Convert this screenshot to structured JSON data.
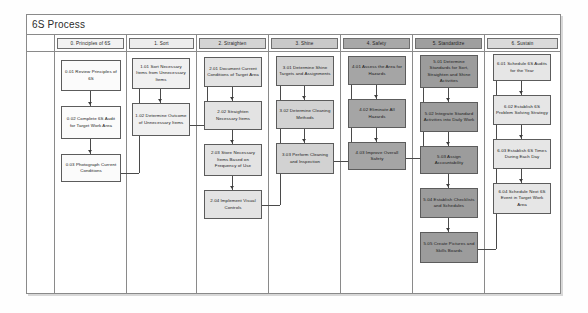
{
  "document": {
    "title": "6S Process"
  },
  "lanes": [
    {
      "id": "lane-principles",
      "label": "0. Principles of 6S"
    },
    {
      "id": "lane-sort",
      "label": "1. Sort"
    },
    {
      "id": "lane-straighten",
      "label": "2. Straighten"
    },
    {
      "id": "lane-shine",
      "label": "3. Shine"
    },
    {
      "id": "lane-safety",
      "label": "4. Safety"
    },
    {
      "id": "lane-standardize",
      "label": "5. Standardize"
    },
    {
      "id": "lane-sustain",
      "label": "6. Sustain"
    }
  ],
  "nodes": {
    "c0": [
      {
        "id": "0.01",
        "label": "0.01 Review Principles of 6S"
      },
      {
        "id": "0.02",
        "label": "0.02 Complete 6S Audit for Target Work Area"
      },
      {
        "id": "0.03",
        "label": "0.03 Photograph Current Conditions"
      }
    ],
    "c1": [
      {
        "id": "1.01",
        "label": "1.01 Sort Necessary Items from Unnecessary Items"
      },
      {
        "id": "1.02",
        "label": "1.02 Determine Outcome of Unnecessary Items"
      }
    ],
    "c2": [
      {
        "id": "2.01",
        "label": "2.01 Document Current Conditions of Target Area"
      },
      {
        "id": "2.02",
        "label": "2.02 Straighten Necessary Items"
      },
      {
        "id": "2.03",
        "label": "2.03 Store Necessary Items Based on Frequency of Use"
      },
      {
        "id": "2.04",
        "label": "2.04 Implement Visual Controls"
      }
    ],
    "c3": [
      {
        "id": "3.01",
        "label": "3.01 Determine Shine Targets and Assignments"
      },
      {
        "id": "3.02",
        "label": "3.02 Determine Cleaning Methods"
      },
      {
        "id": "3.03",
        "label": "3.03 Perform Cleaning and Inspection"
      }
    ],
    "c4": [
      {
        "id": "4.01",
        "label": "4.01 Assess the Area for Hazards"
      },
      {
        "id": "4.02",
        "label": "4.02 Eliminate All Hazards"
      },
      {
        "id": "4.03",
        "label": "4.03 Improve Overall Safety"
      }
    ],
    "c5": [
      {
        "id": "5.01",
        "label": "5.01 Determine Standards for Sort, Straighten and Shine Activities"
      },
      {
        "id": "5.02",
        "label": "5.02 Integrate Standard Activities into Daily Work"
      },
      {
        "id": "5.03",
        "label": "5.03 Assign Accountability"
      },
      {
        "id": "5.04",
        "label": "5.04 Establish Checklists and Schedules"
      },
      {
        "id": "5.05",
        "label": "5.05 Create Pictures and Skills Boards"
      }
    ],
    "c6": [
      {
        "id": "6.01",
        "label": "6.01 Schedule 6S Audits for the Year"
      },
      {
        "id": "6.02",
        "label": "6.02 Establish 6S Problem Solving Strategy"
      },
      {
        "id": "6.03",
        "label": "6.03 Establish 6S Times During Each Day"
      },
      {
        "id": "6.04",
        "label": "6.04 Schedule Next 6S Event in Target Work Area"
      }
    ]
  },
  "colors": {
    "border": "#5c5c5c",
    "connector": "#4a4a4a",
    "lane_line": "#8a8a8a",
    "fill_light": "#fbfbfb",
    "fill_mid": "#d2d2d2",
    "fill_dark": "#9c9c9c"
  }
}
